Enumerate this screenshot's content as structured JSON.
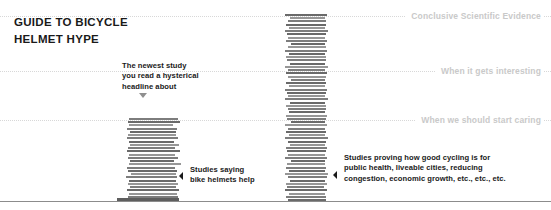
{
  "title": {
    "text": "GUIDE TO BICYCLE\nHELMET HYPE"
  },
  "gridlines": [
    {
      "label": "Conclusive Scientific Evidence",
      "y": 16
    },
    {
      "label": "When it gets interesting",
      "y": 71
    },
    {
      "label": "When we should start caring",
      "y": 120
    }
  ],
  "baseline": {
    "y": 201
  },
  "annotations": {
    "newest_study": {
      "text": "The newest study\nyou read a hysterical\nheadline about",
      "marker": "chevron-down-icon"
    },
    "helmets": {
      "text": "Studies saying\nbike helmets help",
      "marker": "chevron-left-icon"
    },
    "cycling_benefits": {
      "text": "Studies proving how good cycling is for\npublic health, liveable cities, reducing\ncongestion, economic growth, etc., etc., etc.",
      "marker": "chevron-left-icon"
    }
  },
  "colors": {
    "paper": "#7d7d7d",
    "gridline": "#d8d8d8",
    "gridline_label": "#c9c9c9",
    "baseline": "#8c8c8c",
    "text": "#1a1a1a"
  },
  "chart_data": {
    "type": "bar",
    "title": "GUIDE TO BICYCLE HELMET HYPE",
    "xlabel": "",
    "ylabel": "",
    "grid": true,
    "legend_position": "none",
    "axis_tick_labels": [
      "Conclusive Scientific Evidence",
      "When it gets interesting",
      "When we should start caring"
    ],
    "categories": [
      "Studies saying bike helmets help",
      "Studies proving how good cycling is for public health, liveable cities, reducing congestion, economic growth, etc., etc., etc."
    ],
    "values": [
      88,
      196
    ],
    "ylim": [
      0,
      201
    ],
    "annotations": [
      "The newest study you read a hysterical headline about"
    ]
  },
  "stacks": {
    "helmets": {
      "x": 128,
      "count": 26,
      "widths": [
        62,
        50,
        48,
        52,
        46,
        50,
        47,
        51,
        45,
        49,
        48,
        52,
        44,
        50,
        46,
        53,
        47,
        49,
        45,
        51,
        48,
        46,
        50,
        44,
        52,
        49
      ],
      "offsets": [
        -11,
        0,
        1,
        -1,
        2,
        0,
        1,
        -2,
        3,
        0,
        -1,
        1,
        2,
        0,
        1,
        -1,
        0,
        2,
        1,
        -1,
        0,
        2,
        -1,
        1,
        0,
        1
      ],
      "highlight_index": 0
    },
    "evidence": {
      "x": 286,
      "count": 58,
      "widths": [
        38,
        40,
        36,
        42,
        37,
        41,
        35,
        39,
        43,
        36,
        40,
        38,
        34,
        42,
        37,
        39,
        41,
        35,
        38,
        43,
        36,
        40,
        37,
        42,
        34,
        39,
        41,
        36,
        38,
        40,
        35,
        43,
        37,
        39,
        42,
        36,
        40,
        34,
        38,
        41,
        37,
        43,
        35,
        39,
        40,
        36,
        42,
        38,
        34,
        41,
        37,
        39,
        43,
        36,
        40,
        38,
        35,
        42
      ],
      "offsets": [
        2,
        0,
        3,
        -1,
        1,
        0,
        4,
        2,
        -1,
        3,
        0,
        1,
        5,
        -1,
        2,
        1,
        0,
        4,
        2,
        -1,
        3,
        0,
        2,
        -1,
        5,
        1,
        0,
        3,
        2,
        0,
        4,
        -1,
        2,
        1,
        -1,
        3,
        0,
        5,
        2,
        0,
        2,
        -1,
        4,
        1,
        0,
        3,
        -1,
        2,
        5,
        0,
        2,
        1,
        -1,
        3,
        0,
        2,
        4,
        -1
      ]
    }
  }
}
